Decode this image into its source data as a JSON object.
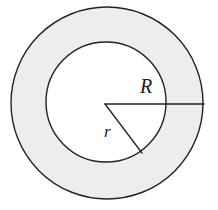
{
  "figure": {
    "kind": "annulus-diagram",
    "background_color": "#ffffff",
    "canvas": {
      "width": 218,
      "height": 210
    }
  },
  "shapes": {
    "outer_circle": {
      "name": "outer-circle",
      "center_x": 107,
      "center_y": 103,
      "radius": 96,
      "fill": "#ededed",
      "stroke": "#222222",
      "stroke_width": 1.4
    },
    "inner_circle": {
      "name": "inner-circle",
      "center_x": 106,
      "center_y": 102,
      "radius": 60,
      "fill": "#ffffff",
      "stroke": "#222222",
      "stroke_width": 1.4
    }
  },
  "radii": {
    "outer_radius_line": {
      "name": "radius-R-line",
      "x1": 105,
      "y1": 104,
      "x2": 204,
      "y2": 104,
      "stroke": "#222222",
      "stroke_width": 1.3
    },
    "inner_radius_line": {
      "name": "radius-r-line",
      "x1": 105,
      "y1": 104,
      "x2": 142,
      "y2": 153,
      "stroke": "#222222",
      "stroke_width": 1.3
    }
  },
  "labels": {
    "outer_radius": "R",
    "inner_radius": "r"
  },
  "colors": {
    "annulus_fill": "#ededed",
    "disk_fill": "#ffffff",
    "ink": "#222222",
    "label_ink": "#1a1a1a"
  }
}
